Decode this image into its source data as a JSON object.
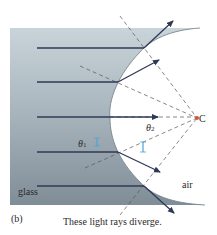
{
  "figure": {
    "panel_label": "(b)",
    "caption": "These light rays diverge.",
    "regions": {
      "glass_label": "glass",
      "air_label": "air"
    },
    "center_label": "C",
    "angles": {
      "theta1": "θ",
      "theta1_sub": "1",
      "theta2": "θ",
      "theta2_sub": "2"
    },
    "colors": {
      "glass_fill": "#9aa9b4",
      "ray": "#2e3a55",
      "normal_dashed": "#555555",
      "angle_marker": "#4aa3d8",
      "center_point": "#d9533a"
    },
    "rays": [
      {
        "y": 48,
        "hit_x": 144,
        "refracted": "up-right"
      },
      {
        "y": 82,
        "hit_x": 118,
        "refracted": "up-right"
      },
      {
        "y": 117,
        "hit_x": 110,
        "refracted": "straight"
      },
      {
        "y": 152,
        "hit_x": 118,
        "refracted": "down-right"
      },
      {
        "y": 186,
        "hit_x": 144,
        "refracted": "down-right"
      }
    ]
  }
}
